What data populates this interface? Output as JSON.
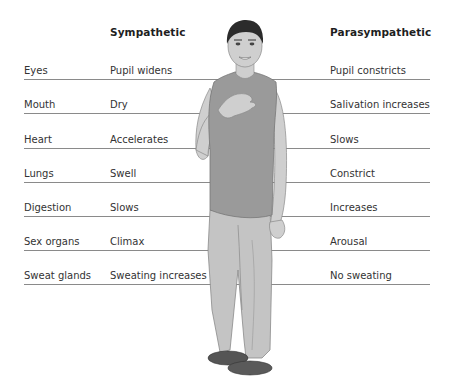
{
  "headers": {
    "sympathetic": "Sympathetic",
    "parasympathetic": "Parasympathetic"
  },
  "rows": [
    {
      "organ": "Eyes",
      "sympathetic": "Pupil widens",
      "parasympathetic": "Pupil constricts"
    },
    {
      "organ": "Mouth",
      "sympathetic": "Dry",
      "parasympathetic": "Salivation increases"
    },
    {
      "organ": "Heart",
      "sympathetic": "Accelerates",
      "parasympathetic": "Slows"
    },
    {
      "organ": "Lungs",
      "sympathetic": "Swell",
      "parasympathetic": "Constrict"
    },
    {
      "organ": "Digestion",
      "sympathetic": "Slows",
      "parasympathetic": "Increases"
    },
    {
      "organ": "Sex organs",
      "sympathetic": "Climax",
      "parasympathetic": "Arousal"
    },
    {
      "organ": "Sweat glands",
      "sympathetic": "Sweating increases",
      "parasympathetic": "No sweating"
    }
  ],
  "figure": {
    "colors": {
      "skin": "#cfcfcf",
      "hair": "#2b2b2b",
      "shirt": "#9a9a9a",
      "trousers": "#c4c4c4",
      "shoes": "#5a5a5a",
      "outline": "#7a7a7a"
    }
  },
  "colors": {
    "rule_line": "#8a8a8a",
    "text": "#333333",
    "background": "#ffffff"
  }
}
